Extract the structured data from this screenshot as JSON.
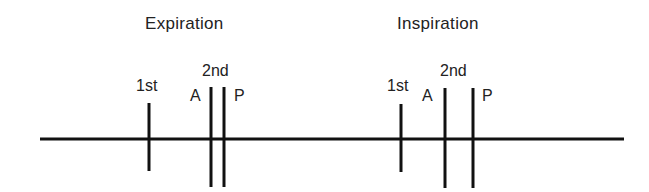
{
  "diagram": {
    "type": "heart-sound-timing",
    "phases": [
      {
        "title": "Expiration",
        "first_label": "1st",
        "second_label": "2nd",
        "a_label": "A",
        "p_label": "P"
      },
      {
        "title": "Inspiration",
        "first_label": "1st",
        "second_label": "2nd",
        "a_label": "A",
        "p_label": "P"
      }
    ],
    "colors": {
      "line": "#111111",
      "text": "#222222",
      "background": "#ffffff"
    }
  }
}
